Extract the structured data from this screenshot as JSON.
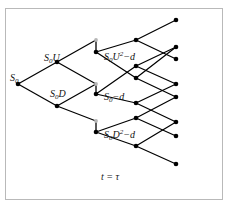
{
  "figure": {
    "caption_ghost": "",
    "frame_color": "#b9b9b9",
    "background": "#ffffff",
    "edge_color": "#000000",
    "node_color": "#000000",
    "ghost_node_color": "#b5b5b5",
    "time_axis_label": "t = τ"
  },
  "labels": {
    "root": {
      "base": "S",
      "sub": "0",
      "sup": "",
      "tail": "",
      "x": 10,
      "y": 73
    },
    "up_one": {
      "base": "S",
      "sub": "0",
      "sup": "",
      "tail": "U",
      "x": 44,
      "y": 53
    },
    "down_one": {
      "base": "S",
      "sub": "0",
      "sup": "",
      "tail": "D",
      "x": 50,
      "y": 89
    },
    "up_two_exdiv": {
      "base": "S",
      "sub": "0",
      "sup": "2",
      "tail": "U",
      "suffix": "−d",
      "x": 104,
      "y": 52
    },
    "mid_exdiv": {
      "base": "S",
      "sub": "0",
      "sup": "",
      "tail": "",
      "suffix": "−d",
      "x": 104,
      "y": 92
    },
    "down_two_exdiv": {
      "base": "S",
      "sub": "0",
      "sup": "2",
      "tail": "D",
      "suffix": "−d",
      "x": 104,
      "y": 130
    }
  },
  "tree_data": {
    "type": "binomial-lattice",
    "steps": 4,
    "dividend_drop_at_step": 2,
    "nodes": [
      {
        "id": "n0",
        "col": 0,
        "x": 18,
        "y": 84,
        "kind": "solid",
        "label": "S0"
      },
      {
        "id": "n1u",
        "col": 1,
        "x": 57,
        "y": 62,
        "kind": "solid",
        "label": "S0U"
      },
      {
        "id": "n1d",
        "col": 1,
        "x": 57,
        "y": 106,
        "kind": "solid",
        "label": "S0D"
      },
      {
        "id": "g2u",
        "col": 2,
        "x": 96,
        "y": 40,
        "kind": "ghost",
        "label": "S0U2"
      },
      {
        "id": "g2m",
        "col": 2,
        "x": 96,
        "y": 84,
        "kind": "ghost",
        "label": "S0"
      },
      {
        "id": "g2d",
        "col": 2,
        "x": 96,
        "y": 121,
        "kind": "ghost",
        "label": "S0D2"
      },
      {
        "id": "n2u",
        "col": 2,
        "x": 96,
        "y": 52,
        "kind": "solid",
        "label": "S0U2-d"
      },
      {
        "id": "n2m",
        "col": 2,
        "x": 96,
        "y": 94,
        "kind": "solid",
        "label": "S0-d"
      },
      {
        "id": "n2d",
        "col": 2,
        "x": 96,
        "y": 132,
        "kind": "solid",
        "label": "S0D2-d"
      },
      {
        "id": "n3a",
        "col": 3,
        "x": 136,
        "y": 40,
        "kind": "solid",
        "label": ""
      },
      {
        "id": "n3b",
        "col": 3,
        "x": 136,
        "y": 66,
        "kind": "solid",
        "label": ""
      },
      {
        "id": "n3c",
        "col": 3,
        "x": 136,
        "y": 78,
        "kind": "solid",
        "label": ""
      },
      {
        "id": "n3d",
        "col": 3,
        "x": 136,
        "y": 103,
        "kind": "solid",
        "label": ""
      },
      {
        "id": "n3e",
        "col": 3,
        "x": 136,
        "y": 118,
        "kind": "solid",
        "label": ""
      },
      {
        "id": "n3f",
        "col": 3,
        "x": 136,
        "y": 146,
        "kind": "solid",
        "label": ""
      },
      {
        "id": "n4a",
        "col": 4,
        "x": 176,
        "y": 20,
        "kind": "solid",
        "label": ""
      },
      {
        "id": "n4b",
        "col": 4,
        "x": 176,
        "y": 47,
        "kind": "solid",
        "label": ""
      },
      {
        "id": "n4c",
        "col": 4,
        "x": 176,
        "y": 59,
        "kind": "solid",
        "label": ""
      },
      {
        "id": "n4d",
        "col": 4,
        "x": 176,
        "y": 84,
        "kind": "solid",
        "label": ""
      },
      {
        "id": "n4e",
        "col": 4,
        "x": 176,
        "y": 97,
        "kind": "solid",
        "label": ""
      },
      {
        "id": "n4f",
        "col": 4,
        "x": 176,
        "y": 122,
        "kind": "solid",
        "label": ""
      },
      {
        "id": "n4g",
        "col": 4,
        "x": 176,
        "y": 136,
        "kind": "solid",
        "label": ""
      },
      {
        "id": "n4h",
        "col": 4,
        "x": 176,
        "y": 164,
        "kind": "solid",
        "label": ""
      }
    ],
    "edges": [
      {
        "from": "n0",
        "to": "n1u",
        "kind": "up"
      },
      {
        "from": "n0",
        "to": "n1d",
        "kind": "down"
      },
      {
        "from": "n1u",
        "to": "g2u",
        "kind": "up"
      },
      {
        "from": "n1u",
        "to": "g2m",
        "kind": "down"
      },
      {
        "from": "n1d",
        "to": "g2m",
        "kind": "up"
      },
      {
        "from": "n1d",
        "to": "g2d",
        "kind": "down"
      },
      {
        "from": "g2u",
        "to": "n2u",
        "kind": "dividend-drop"
      },
      {
        "from": "g2m",
        "to": "n2m",
        "kind": "dividend-drop"
      },
      {
        "from": "g2d",
        "to": "n2d",
        "kind": "dividend-drop"
      },
      {
        "from": "n2u",
        "to": "n3a",
        "kind": "up"
      },
      {
        "from": "n2u",
        "to": "n3c",
        "kind": "down"
      },
      {
        "from": "n2m",
        "to": "n3b",
        "kind": "up"
      },
      {
        "from": "n2m",
        "to": "n3d",
        "kind": "down"
      },
      {
        "from": "n2d",
        "to": "n3e",
        "kind": "up"
      },
      {
        "from": "n2d",
        "to": "n3f",
        "kind": "down"
      },
      {
        "from": "n3a",
        "to": "n4a",
        "kind": "up"
      },
      {
        "from": "n3a",
        "to": "n4c",
        "kind": "down"
      },
      {
        "from": "n3b",
        "to": "n4b",
        "kind": "up"
      },
      {
        "from": "n3b",
        "to": "n4d",
        "kind": "down"
      },
      {
        "from": "n3c",
        "to": "n4b",
        "kind": "up"
      },
      {
        "from": "n3c",
        "to": "n4e",
        "kind": "down"
      },
      {
        "from": "n3d",
        "to": "n4d",
        "kind": "up"
      },
      {
        "from": "n3d",
        "to": "n4f",
        "kind": "down"
      },
      {
        "from": "n3e",
        "to": "n4e",
        "kind": "up"
      },
      {
        "from": "n3e",
        "to": "n4g",
        "kind": "down"
      },
      {
        "from": "n3f",
        "to": "n4f",
        "kind": "up"
      },
      {
        "from": "n3f",
        "to": "n4h",
        "kind": "down"
      }
    ]
  },
  "time_axis": {
    "text": "t = τ",
    "x": 101,
    "y": 172
  }
}
